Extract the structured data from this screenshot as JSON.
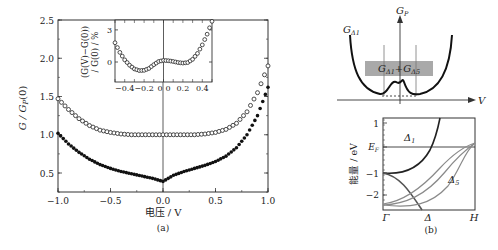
{
  "chart_data": [
    {
      "panel": "(a)",
      "type": "scatter",
      "title": "",
      "xlabel": "电压 / V",
      "ylabel": "G / G_P(0)",
      "xlim": [
        -1.0,
        1.0
      ],
      "ylim": [
        0.25,
        2.5
      ],
      "xticks": [
        "−1.0",
        "−0.5",
        "0.0",
        "0.5",
        "1.0"
      ],
      "yticks": [
        "0.5",
        "1.0",
        "1.5",
        "2.0",
        "2.5"
      ],
      "grid": false,
      "vertical_line_at_x": 0.0,
      "series": [
        {
          "name": "open circles (upper)",
          "marker": "open-circle",
          "x": [
            -1.0,
            -0.9,
            -0.8,
            -0.7,
            -0.6,
            -0.5,
            -0.4,
            -0.3,
            -0.2,
            -0.1,
            0.0,
            0.1,
            0.2,
            0.3,
            0.4,
            0.5,
            0.6,
            0.7,
            0.8,
            0.9,
            1.0
          ],
          "y": [
            1.47,
            1.33,
            1.21,
            1.12,
            1.06,
            1.03,
            1.01,
            1.0,
            1.0,
            1.0,
            1.0,
            1.0,
            1.0,
            1.0,
            1.01,
            1.03,
            1.07,
            1.15,
            1.3,
            1.55,
            1.9
          ]
        },
        {
          "name": "filled circles (lower)",
          "marker": "filled-circle",
          "x": [
            -1.0,
            -0.9,
            -0.8,
            -0.7,
            -0.6,
            -0.5,
            -0.4,
            -0.3,
            -0.2,
            -0.1,
            0.0,
            0.1,
            0.2,
            0.3,
            0.4,
            0.5,
            0.6,
            0.7,
            0.8,
            0.9,
            1.0
          ],
          "y": [
            1.02,
            0.88,
            0.77,
            0.68,
            0.61,
            0.56,
            0.52,
            0.49,
            0.46,
            0.43,
            0.39,
            0.47,
            0.52,
            0.56,
            0.6,
            0.65,
            0.72,
            0.83,
            1.0,
            1.25,
            1.62
          ]
        }
      ],
      "inset": {
        "type": "scatter",
        "ylabel": "(G(V)−G(0)) / G(0) / %",
        "xlim": [
          -0.5,
          0.5
        ],
        "ylim": [
          -1.9,
          3.8
        ],
        "xticks": [
          "−0.4",
          "−0.2",
          "0",
          "0",
          "0.2",
          "0.4"
        ],
        "yticks": [
          "0",
          "3"
        ],
        "series": [
          {
            "name": "inset open circles",
            "marker": "open-circle",
            "x": [
              -0.5,
              -0.45,
              -0.4,
              -0.35,
              -0.3,
              -0.25,
              -0.2,
              -0.15,
              -0.1,
              -0.05,
              0.0,
              0.05,
              0.1,
              0.15,
              0.2,
              0.25,
              0.3,
              0.35,
              0.4,
              0.45,
              0.5
            ],
            "y": [
              1.8,
              0.9,
              0.2,
              -0.3,
              -0.65,
              -0.8,
              -0.78,
              -0.6,
              -0.25,
              0.05,
              0.15,
              0.12,
              0.05,
              -0.05,
              -0.1,
              -0.05,
              0.25,
              0.8,
              1.6,
              2.6,
              3.8
            ]
          }
        ]
      }
    },
    {
      "panel": "(b) upper",
      "type": "diagram",
      "labels": {
        "curve_label": "G_Δ1",
        "y_axis": "G_P",
        "x_axis": "V",
        "band_box": "G_Δ1+G_Δ5"
      },
      "band_box_color": "#a9a9a9"
    },
    {
      "panel": "(b) lower",
      "type": "line",
      "title": "",
      "xlabel": "",
      "ylabel": "能量 / eV",
      "xtick_labels": [
        "Γ",
        "Δ",
        "H"
      ],
      "ytick_labels": [
        "1",
        "E_F",
        "−1",
        "−2"
      ],
      "ylim": [
        -2.5,
        1.3
      ],
      "fermi_level": 0,
      "band_labels": [
        "Δ1",
        "Δ5"
      ],
      "series": [
        {
          "name": "Δ1",
          "color": "#222222",
          "x": [
            0,
            0.2,
            0.4,
            0.6,
            0.7
          ],
          "y": [
            -1.0,
            -0.9,
            -0.5,
            0.4,
            1.3
          ]
        },
        {
          "name": "band Γ(-1) down",
          "color": "#555555",
          "x": [
            0,
            0.2,
            0.35,
            0.5
          ],
          "y": [
            -1.0,
            -1.3,
            -1.9,
            -2.5
          ]
        },
        {
          "name": "Δ5 upper",
          "color": "#888888",
          "x": [
            0,
            0.3,
            0.6,
            1.0
          ],
          "y": [
            -2.35,
            -2.0,
            -0.9,
            0.25
          ]
        },
        {
          "name": "Δ5 middle",
          "color": "#888888",
          "x": [
            0,
            0.3,
            0.6,
            1.0
          ],
          "y": [
            -2.4,
            -2.2,
            -1.3,
            0.2
          ]
        },
        {
          "name": "Δ5 lower",
          "color": "#888888",
          "x": [
            0,
            0.3,
            0.6,
            0.8,
            1.0
          ],
          "y": [
            -2.4,
            -2.4,
            -1.9,
            -0.6,
            0.2
          ]
        }
      ]
    }
  ],
  "captions": {
    "a": "(a)",
    "b": "(b)"
  },
  "panel_a": {
    "ylabel": "G / G",
    "ylabel_sub": "P",
    "ylabel_tail": "(0)",
    "xlabel": "电压 / V",
    "xticks": [
      "−1.0",
      "−0.5",
      "0.0",
      "0.5",
      "1.0"
    ],
    "yticks": [
      "0.5",
      "1.0",
      "1.5",
      "2.0",
      "2.5"
    ],
    "inset_ylabel_1": "(G(V)−G(0))",
    "inset_ylabel_2": "/ G(0) / %",
    "inset_yticks": [
      "3",
      "0"
    ],
    "inset_xticks": [
      "−0.4",
      "−0.2",
      "0",
      "0",
      "0.2",
      "0.4"
    ]
  },
  "panel_b_top": {
    "curve_label": "G",
    "curve_label_sub": "Δ1",
    "yaxis_label": "G",
    "yaxis_label_sub": "P",
    "xaxis_label": "V",
    "box_label_a": "G",
    "box_label_a_sub": "Δ1",
    "box_label_plus": "+",
    "box_label_b": "G",
    "box_label_b_sub": "Δ5"
  },
  "panel_b_bottom": {
    "ylabel": "能量 / eV",
    "yticks": [
      "1",
      "−1",
      "−2"
    ],
    "ef_label": "E",
    "ef_sub": "F",
    "band1_label": "Δ",
    "band1_sub": "1",
    "band5_label": "Δ",
    "band5_sub": "5",
    "xticks": [
      "Γ",
      "Δ",
      "H"
    ]
  }
}
